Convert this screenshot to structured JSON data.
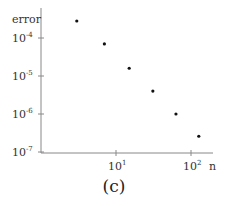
{
  "chart_data": {
    "type": "scatter",
    "title": "",
    "caption": "(c)",
    "xlabel": "n",
    "ylabel": "error",
    "xscale": "log",
    "yscale": "log",
    "xlim": [
      2,
      180
    ],
    "ylim": [
      1e-07,
      0.0004
    ],
    "x_ticks": [
      {
        "value": 10,
        "base": "10",
        "exp": "1"
      },
      {
        "value": 100,
        "base": "10",
        "exp": "2"
      }
    ],
    "y_ticks": [
      {
        "value": 0.0001,
        "base": "10",
        "exp": "-4"
      },
      {
        "value": 1e-05,
        "base": "10",
        "exp": "-5"
      },
      {
        "value": 1e-06,
        "base": "10",
        "exp": "-6"
      },
      {
        "value": 1e-07,
        "base": "10",
        "exp": "-7"
      }
    ],
    "grid": false,
    "legend": null,
    "series": [
      {
        "name": "error",
        "x": [
          3,
          7,
          15,
          31,
          63,
          127
        ],
        "y": [
          0.00028,
          7e-05,
          1.6e-05,
          4e-06,
          1e-06,
          2.6e-07
        ]
      }
    ]
  }
}
